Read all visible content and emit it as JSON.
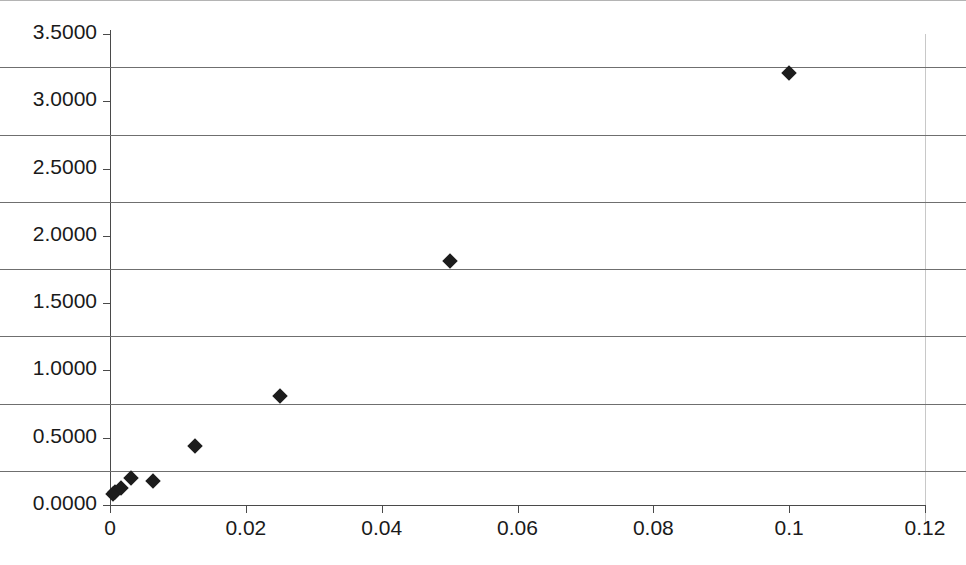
{
  "chart_data": {
    "type": "scatter",
    "title": "",
    "subtitle": "",
    "xlabel": "",
    "ylabel": "",
    "xlim": [
      0,
      0.12
    ],
    "ylim": [
      0,
      3.5
    ],
    "grid": "horizontal",
    "legend": "none",
    "marker_style": "diamond",
    "marker_color": "#1c1c1c",
    "background_color": "#ffffff",
    "gridline_color": "#6f6f6f",
    "x_ticks": [
      0,
      0.02,
      0.04,
      0.06,
      0.08,
      0.1,
      0.12
    ],
    "x_tick_labels": [
      "0",
      "0.02",
      "0.04",
      "0.06",
      "0.08",
      "0.1",
      "0.12"
    ],
    "y_ticks": [
      0,
      0.5,
      1.0,
      1.5,
      2.0,
      2.5,
      3.0,
      3.5
    ],
    "y_tick_labels": [
      "0.0000",
      "0.5000",
      "1.0000",
      "1.5000",
      "2.0000",
      "2.5000",
      "3.0000",
      "3.5000"
    ],
    "points": [
      {
        "x": 0.0004,
        "y": 0.08
      },
      {
        "x": 0.0008,
        "y": 0.1
      },
      {
        "x": 0.0016,
        "y": 0.13
      },
      {
        "x": 0.0031,
        "y": 0.2
      },
      {
        "x": 0.0063,
        "y": 0.18
      },
      {
        "x": 0.0125,
        "y": 0.44
      },
      {
        "x": 0.025,
        "y": 0.81
      },
      {
        "x": 0.05,
        "y": 1.81
      },
      {
        "x": 0.1,
        "y": 3.21
      }
    ]
  }
}
